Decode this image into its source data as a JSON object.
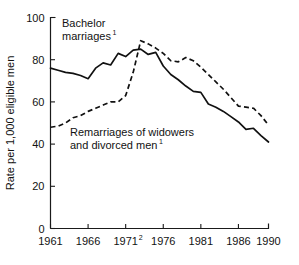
{
  "chart_data": {
    "type": "line",
    "title": "",
    "xlabel": "",
    "ylabel": "Rate per 1,000 eligible men",
    "xlim": [
      1961,
      1990
    ],
    "ylim": [
      0,
      100
    ],
    "grid": false,
    "legend_position": "inline-annotation",
    "x_tick_labels": [
      "1961",
      "1966",
      "1971",
      "1976",
      "1981",
      "1986",
      "1990"
    ],
    "x_tick_values": [
      1961,
      1966,
      1971,
      1976,
      1981,
      1986,
      1990
    ],
    "x_tick_superscripts": [
      "",
      "",
      "2",
      "",
      "",
      "",
      ""
    ],
    "y_tick_labels": [
      "0",
      "20",
      "40",
      "60",
      "80",
      "100"
    ],
    "y_tick_values": [
      0,
      20,
      40,
      60,
      80,
      100
    ],
    "x": [
      1961,
      1962,
      1963,
      1964,
      1965,
      1966,
      1967,
      1968,
      1969,
      1970,
      1971,
      1972,
      1973,
      1974,
      1975,
      1976,
      1977,
      1978,
      1979,
      1980,
      1981,
      1982,
      1983,
      1984,
      1985,
      1986,
      1987,
      1988,
      1989,
      1990
    ],
    "series": [
      {
        "name": "Bachelor marriages",
        "style": "solid",
        "annotation_label": "Bachelor",
        "annotation_label2": "marriages",
        "annotation_superscript": "1",
        "values": [
          76,
          75,
          74,
          73.5,
          72.5,
          71,
          76,
          78.5,
          77.5,
          83,
          81.5,
          84.5,
          85,
          82.5,
          83.5,
          77,
          73,
          70.5,
          67.5,
          65,
          64.5,
          59,
          57.5,
          55.5,
          53,
          50.5,
          47,
          47.5,
          44,
          41
        ]
      },
      {
        "name": "Remarriages of widowers and divorced men",
        "style": "dashed",
        "annotation_label": "Remarriages of widowers",
        "annotation_label2": "and divorced men",
        "annotation_superscript": "1",
        "values": [
          48,
          48.5,
          50,
          52.5,
          53.5,
          55.5,
          57,
          58.5,
          60,
          60,
          63,
          74,
          89,
          87.5,
          85.5,
          83,
          79.5,
          79,
          81,
          79.5,
          76.5,
          73,
          69.5,
          66,
          62,
          58,
          57.5,
          57,
          53.5,
          49
        ]
      }
    ]
  }
}
